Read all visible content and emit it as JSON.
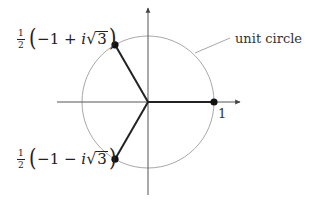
{
  "diagram": {
    "origin": {
      "x": 148,
      "y": 102
    },
    "radius_px": 66,
    "colors": {
      "axis": "#555555",
      "circle": "#a8a8a8",
      "spoke": "#222222",
      "point": "#111111",
      "leader": "#a8a8a8"
    },
    "axes": {
      "x": {
        "x1": 57,
        "x2": 240
      },
      "y": {
        "y1": 8,
        "y2": 195
      }
    },
    "points": [
      {
        "id": "root-1",
        "angle_deg": 0,
        "label": "1"
      },
      {
        "id": "root-omega",
        "angle_deg": 120,
        "label": "½(−1 + i√3)"
      },
      {
        "id": "root-omega2",
        "angle_deg": 240,
        "label": "½(−1 − i√3)"
      }
    ],
    "labels": {
      "one": "1",
      "unit_circle": "unit circle",
      "upper": {
        "frac_num": "1",
        "frac_den": "2",
        "lparen": "(",
        "minus_one": "−1",
        "op": " + ",
        "i": "i",
        "radical": "√",
        "radicand": "3",
        "rparen": ")"
      },
      "lower": {
        "frac_num": "1",
        "frac_den": "2",
        "lparen": "(",
        "minus_one": "−1",
        "op": " − ",
        "i": "i",
        "radical": "√",
        "radicand": "3",
        "rparen": ")"
      }
    }
  }
}
